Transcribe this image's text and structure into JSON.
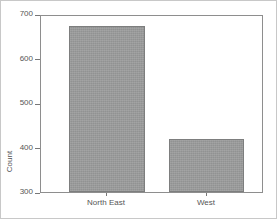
{
  "chart_data": {
    "type": "bar",
    "title": "",
    "xlabel": "",
    "ylabel": "Count",
    "categories": [
      "North East",
      "West"
    ],
    "values": [
      677,
      421
    ],
    "ylim": [
      300,
      700
    ],
    "yticks": [
      300,
      400,
      500,
      600,
      700
    ],
    "ytick_labels": [
      "300",
      "400",
      "500",
      "600",
      "700"
    ],
    "grid": false,
    "legend": false,
    "bar_color": "#9a9b9b",
    "bar_edge_color": "#7d7e7e",
    "axis_color": "#8e8e8e",
    "text_color": "#555555",
    "background": "#ffffff"
  }
}
